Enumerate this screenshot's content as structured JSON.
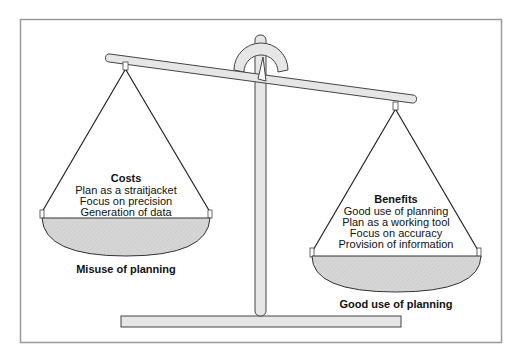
{
  "diagram": {
    "type": "balance-scale",
    "colors": {
      "frame": "#9a9a9a",
      "beam_fill": "#e6e6e6",
      "outline": "#333333",
      "pan_fill": "#d8d8d8"
    }
  },
  "left_pan": {
    "heading": "Costs",
    "items": [
      "Plan as a straitjacket",
      "Focus on precision",
      "Generation of data"
    ],
    "caption": "Misuse of planning"
  },
  "right_pan": {
    "heading": "Benefits",
    "items": [
      "Good use of planning",
      "Plan as a working tool",
      "Focus on accuracy",
      "Provision of information"
    ],
    "caption": "Good use of planning"
  }
}
